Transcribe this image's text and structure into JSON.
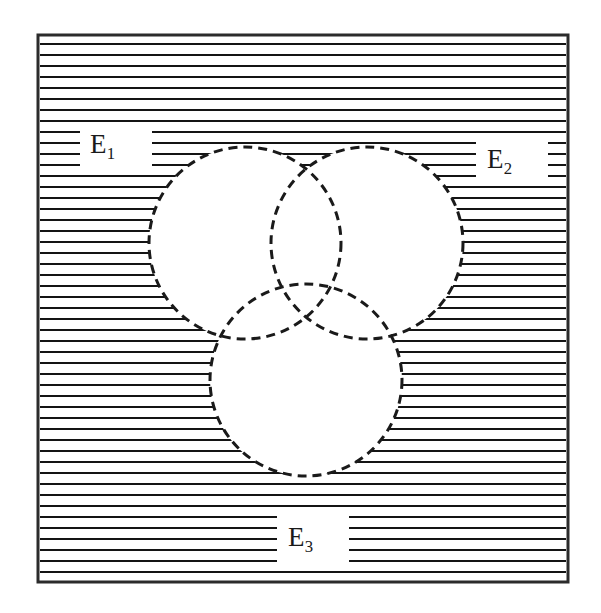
{
  "figure": {
    "width": 601,
    "height": 613,
    "background_color": "#ffffff",
    "ink_color": "#1a1a1a"
  },
  "frame": {
    "name": "universal-set-rectangle",
    "x": 38,
    "y": 35,
    "width": 530,
    "height": 547,
    "border_color": "#2b2b2b",
    "border_width": 3,
    "fill_color": "#ffffff"
  },
  "shading": {
    "style": "horizontal-hatch",
    "description": "Horizontal ruled lines filling the region of the rectangle that lies outside all three circles",
    "line_color": "#141414",
    "line_width": 2,
    "line_spacing": 11,
    "first_line_offset": 9
  },
  "circles": [
    {
      "id": "circle-e1",
      "label": "E1",
      "cx": 245,
      "cy": 243,
      "r": 96,
      "stroke_color": "#1a1a1a",
      "stroke_width": 3,
      "stroke_style": "dashed",
      "dash_pattern": "9 6",
      "fill_color": "#ffffff"
    },
    {
      "id": "circle-e2",
      "label": "E2",
      "cx": 367,
      "cy": 243,
      "r": 96,
      "stroke_color": "#1a1a1a",
      "stroke_width": 3,
      "stroke_style": "dashed",
      "dash_pattern": "9 6",
      "fill_color": "#ffffff"
    },
    {
      "id": "circle-e3",
      "label": "E3",
      "cx": 306,
      "cy": 380,
      "r": 96,
      "stroke_color": "#1a1a1a",
      "stroke_width": 3,
      "stroke_style": "dashed",
      "dash_pattern": "9 6",
      "fill_color": "#ffffff"
    }
  ],
  "labels": {
    "e1": {
      "base": "E",
      "sub": "1",
      "x": 90,
      "y": 131
    },
    "e2": {
      "base": "E",
      "sub": "2",
      "x": 487,
      "y": 146
    },
    "e3": {
      "base": "E",
      "sub": "3",
      "x": 288,
      "y": 524
    }
  },
  "label_gaps": [
    {
      "for": "e1",
      "x": 80,
      "y": 123,
      "width": 72,
      "height": 46
    },
    {
      "for": "e2",
      "x": 476,
      "y": 139,
      "width": 72,
      "height": 46
    },
    {
      "for": "e3",
      "x": 277,
      "y": 516,
      "width": 72,
      "height": 46
    }
  ]
}
